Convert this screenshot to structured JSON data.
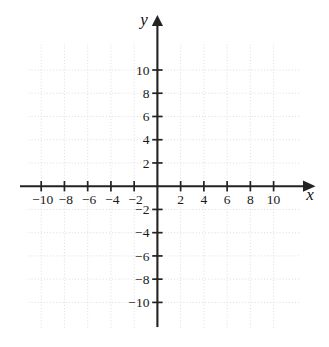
{
  "figure": {
    "title": ""
  },
  "chart_data": {
    "type": "scatter",
    "title": "",
    "subtitle": "",
    "xlabel": "x",
    "ylabel": "y",
    "xlim": [
      -11.6,
      11.9
    ],
    "ylim": [
      -12.4,
      12.4
    ],
    "grid": true,
    "grid_step": 2,
    "legend": "none",
    "series": [],
    "x": [],
    "y": [],
    "annotations": [],
    "axes": {
      "x_tick_values": [
        -10,
        -8,
        -6,
        -4,
        -2,
        2,
        4,
        6,
        8,
        10
      ],
      "x_tick_labels": [
        "−10",
        "−8",
        "−6",
        "−4",
        "−2",
        "2",
        "4",
        "6",
        "8",
        "10"
      ],
      "y_tick_values": [
        10,
        8,
        6,
        4,
        2,
        -2,
        -4,
        -6,
        -8,
        -10
      ],
      "y_tick_labels": [
        "10",
        "8",
        "6",
        "4",
        "2",
        "−2",
        "−4",
        "−6",
        "−8",
        "−10"
      ],
      "x_axis_label": "x",
      "y_axis_label": "y",
      "origin_label": "",
      "x_arrow": "positive-direction",
      "y_arrow": "positive-direction"
    },
    "grid_lines": {
      "vertical_values": [
        -10,
        -8,
        -6,
        -4,
        -2,
        0,
        2,
        4,
        6,
        8,
        10
      ],
      "horizontal_values": [
        -10,
        -8,
        -6,
        -4,
        -2,
        0,
        2,
        4,
        6,
        8,
        10
      ]
    },
    "colors": {
      "axis": "#232323",
      "grid": "#d9d9d9",
      "label": "#1a1a1a",
      "background": "#ffffff"
    }
  }
}
